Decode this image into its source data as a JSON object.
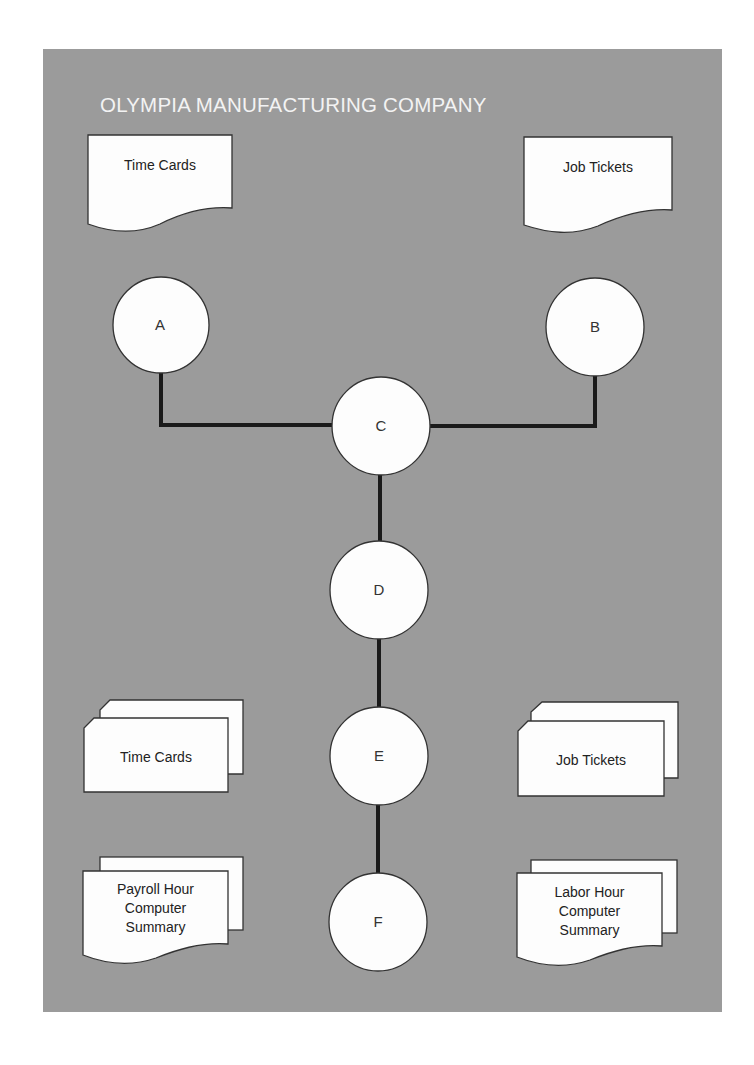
{
  "title": "OLYMPIA MANUFACTURING COMPANY",
  "colors": {
    "panel_background": "#9b9b9b",
    "shape_fill": "#fdfdfd",
    "line": "#1a1a1a",
    "title_text": "#f3f3f3"
  },
  "documents": {
    "top_left": {
      "label": "Time Cards",
      "shape": "document"
    },
    "top_right": {
      "label": "Job Tickets",
      "shape": "document"
    }
  },
  "card_decks": {
    "left": {
      "label": "Time Cards",
      "shape": "punched-card-deck"
    },
    "right": {
      "label": "Job Tickets",
      "shape": "punched-card-deck"
    }
  },
  "reports": {
    "left": {
      "line1": "Payroll Hour",
      "line2": "Computer",
      "line3": "Summary",
      "shape": "multi-document"
    },
    "right": {
      "line1": "Labor Hour",
      "line2": "Computer",
      "line3": "Summary",
      "shape": "multi-document"
    }
  },
  "nodes": [
    {
      "id": "A",
      "label": "A"
    },
    {
      "id": "B",
      "label": "B"
    },
    {
      "id": "C",
      "label": "C"
    },
    {
      "id": "D",
      "label": "D"
    },
    {
      "id": "E",
      "label": "E"
    },
    {
      "id": "F",
      "label": "F"
    }
  ],
  "connections": [
    {
      "from": "A",
      "to": "C"
    },
    {
      "from": "B",
      "to": "C"
    },
    {
      "from": "C",
      "to": "D"
    },
    {
      "from": "D",
      "to": "E"
    },
    {
      "from": "E",
      "to": "F"
    }
  ]
}
